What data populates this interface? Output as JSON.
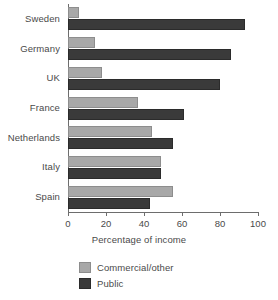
{
  "chart_data": {
    "type": "bar",
    "orientation": "horizontal",
    "title": "",
    "xlabel": "Percentage of income",
    "ylabel": "",
    "xlim": [
      0,
      100
    ],
    "xticks": [
      0,
      20,
      40,
      60,
      80,
      100
    ],
    "xticklabels": [
      "0",
      "20",
      "40",
      "60",
      "80",
      "100"
    ],
    "grid": false,
    "legend_position": "bottom",
    "categories": [
      "Sweden",
      "Germany",
      "UK",
      "France",
      "Netherlands",
      "Italy",
      "Spain"
    ],
    "series": [
      {
        "name": "Commercial/other",
        "color": "#a8a8a8",
        "values": [
          6,
          14,
          18,
          37,
          44,
          49,
          55
        ]
      },
      {
        "name": "Public",
        "color": "#3a3a3a",
        "values": [
          93,
          86,
          80,
          61,
          55,
          49,
          43
        ]
      }
    ]
  },
  "colors": {
    "light_series": "#a8a8a8",
    "dark_series": "#3a3a3a",
    "axis": "#6d6d6d",
    "text": "#4a4a4a",
    "background": "#ffffff"
  }
}
